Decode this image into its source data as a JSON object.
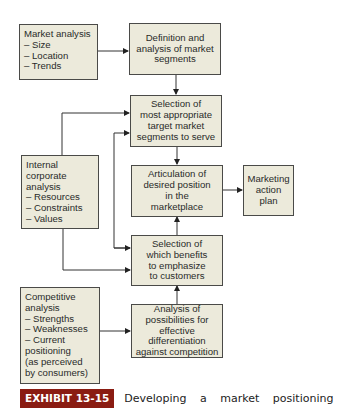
{
  "diagram": {
    "type": "flowchart",
    "nodes": {
      "market_analysis": {
        "text": "Market analysis\n– Size\n– Location\n– Trends"
      },
      "definition": {
        "text": "Definition and\nanalysis of market\nsegments"
      },
      "selection_target": {
        "text": "Selection of\nmost appropriate\ntarget market\nsegments to serve"
      },
      "internal": {
        "text": "Internal\ncorporate\nanalysis\n– Resources\n– Constraints\n– Values"
      },
      "articulation": {
        "text": "Articulation of\ndesired position\nin the\nmarketplace"
      },
      "marketing_plan": {
        "text": "Marketing\naction\nplan"
      },
      "selection_benefits": {
        "text": "Selection of\nwhich benefits\nto emphasize\nto customers"
      },
      "competitive": {
        "text": "Competitive\nanalysis\n– Strengths\n– Weaknesses\n– Current\npositioning\n(as perceived\nby consumers)"
      },
      "differentiation": {
        "text": "Analysis of\npossibilities for\neffective\ndifferentiation\nagainst competition"
      }
    },
    "edges": [
      {
        "from": "market_analysis",
        "to": "definition"
      },
      {
        "from": "definition",
        "to": "selection_target"
      },
      {
        "from": "internal",
        "to": "selection_target"
      },
      {
        "from": "internal",
        "to": "selection_benefits"
      },
      {
        "from": "selection_target",
        "to": "articulation"
      },
      {
        "from": "articulation",
        "to": "marketing_plan"
      },
      {
        "from": "selection_benefits",
        "to": "articulation"
      },
      {
        "from": "selection_benefits",
        "to": "selection_target"
      },
      {
        "from": "competitive",
        "to": "differentiation"
      },
      {
        "from": "differentiation",
        "to": "selection_benefits"
      }
    ],
    "colors": {
      "box_fill": "#eceadb",
      "box_border": "#4a4a48",
      "badge": "#8a1c12"
    }
  },
  "caption": {
    "label": "EXHIBIT 13-15",
    "text": "Developing a market positioning"
  }
}
